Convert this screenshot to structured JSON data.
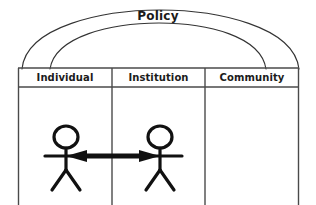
{
  "diagram": {
    "title": "Policy",
    "arcs": [
      {
        "name": "policy-outer-arc"
      },
      {
        "name": "policy-inner-arc"
      }
    ],
    "columns": [
      {
        "id": "individual",
        "label": "Individual"
      },
      {
        "id": "institution",
        "label": "Institution"
      },
      {
        "id": "community",
        "label": "Community"
      }
    ],
    "figures": [
      {
        "id": "individual-person",
        "column": "individual"
      },
      {
        "id": "institution-person",
        "column": "institution"
      }
    ],
    "connector": {
      "name": "bidirectional-arrow",
      "from": "individual-person",
      "to": "institution-person",
      "style": "double-headed"
    },
    "colors": {
      "stroke": "#1b1b1b",
      "arc": "#333333",
      "table_border": "#4a4a4a",
      "background": "#ffffff",
      "text": "#1b1b1b"
    }
  }
}
